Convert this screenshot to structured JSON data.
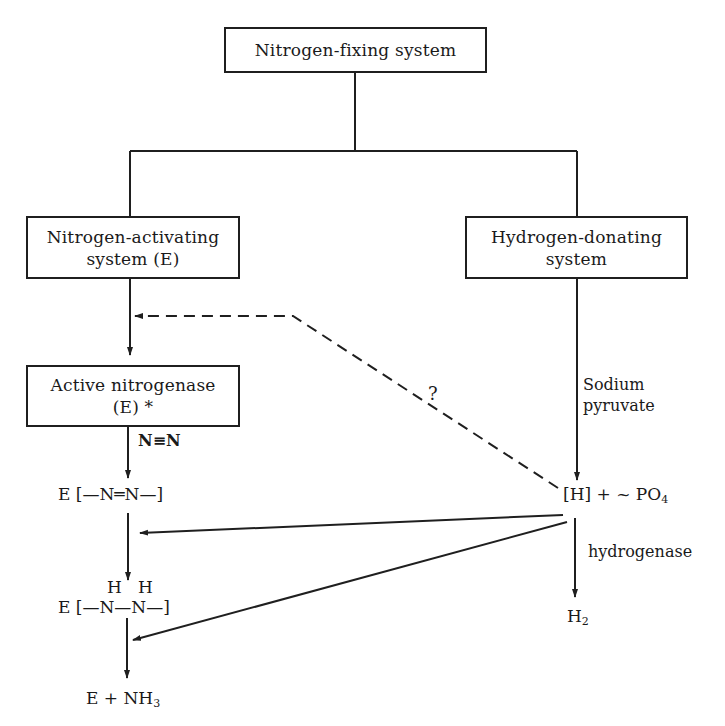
{
  "diagram": {
    "boxes": {
      "root": {
        "label": "Nitrogen-fixing system"
      },
      "n_activating": {
        "line1": "Nitrogen-activating",
        "line2": "system (E)"
      },
      "h_donating": {
        "line1": "Hydrogen-donating",
        "line2": "system"
      },
      "active_nitrogenase": {
        "line1": "Active nitrogenase",
        "line2": "(E) *"
      }
    },
    "labels": {
      "n_triple_n": "N≡N",
      "question": "?",
      "sodium": "Sodium",
      "pyruvate": "pyruvate",
      "hydrogenase": "hydrogenase"
    },
    "chem": {
      "e_diazene": "E [—N═N—]",
      "hh": "H   H",
      "e_hydrazine": "E [—N—N—]",
      "e_nh3_main": "E + NH",
      "e_nh3_sub": "3",
      "h_po4_main": "[H] + ~ PO",
      "h_po4_sub": "4",
      "h2_main": "H",
      "h2_sub": "2"
    },
    "colors": {
      "line": "#1f1f1f",
      "background": "#ffffff"
    }
  }
}
